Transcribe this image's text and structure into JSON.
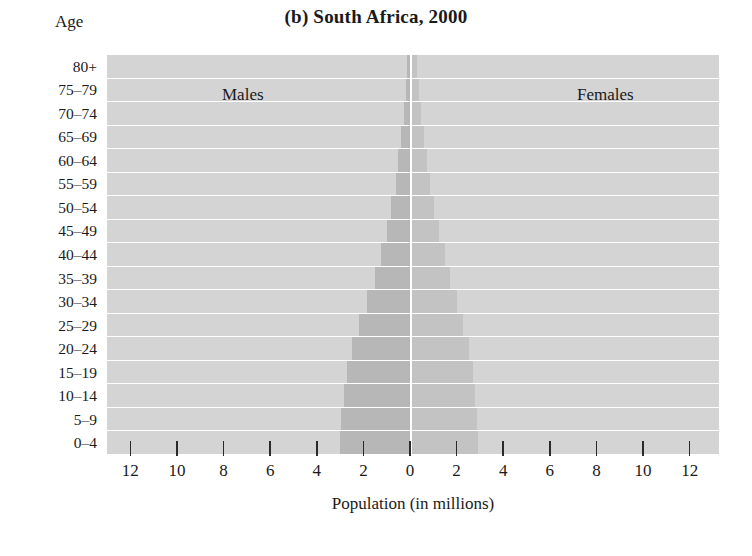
{
  "chart_data": {
    "type": "bar",
    "subtype": "population-pyramid",
    "title": "(b) South Africa, 2000",
    "xlabel": "Population (in millions)",
    "ylabel": "Age",
    "xlim": [
      -13,
      13
    ],
    "xticks": [
      12,
      10,
      8,
      6,
      4,
      2,
      0,
      2,
      4,
      6,
      8,
      10,
      12
    ],
    "grid": false,
    "legend_position": "inside-top",
    "categories": [
      "80+",
      "75–79",
      "70–74",
      "65–69",
      "60–64",
      "55–59",
      "50–54",
      "45–49",
      "40–44",
      "35–39",
      "30–34",
      "25–29",
      "20–24",
      "15–19",
      "10–14",
      "5–9",
      "0–4"
    ],
    "series": [
      {
        "name": "Males",
        "side": "left",
        "color": "#b7b7b7",
        "values": [
          0.12,
          0.18,
          0.26,
          0.38,
          0.5,
          0.62,
          0.8,
          1.0,
          1.25,
          1.5,
          1.85,
          2.2,
          2.5,
          2.7,
          2.85,
          2.95,
          3.0
        ]
      },
      {
        "name": "Females",
        "side": "right",
        "color": "#c3c3c3",
        "values": [
          0.22,
          0.3,
          0.4,
          0.52,
          0.65,
          0.78,
          0.95,
          1.15,
          1.4,
          1.65,
          1.95,
          2.2,
          2.45,
          2.6,
          2.7,
          2.8,
          2.85
        ]
      }
    ]
  },
  "axis": {
    "age_caption": "Age",
    "x_title": "Population (in millions)"
  },
  "colors": {
    "plot_background": "#d4d4d4",
    "male_bar": "#b7b7b7",
    "female_bar": "#c3c3c3",
    "separator": "#ffffff",
    "tick": "#2a2a2a",
    "text": "#1a1a1a",
    "page_background": "#ffffff"
  }
}
